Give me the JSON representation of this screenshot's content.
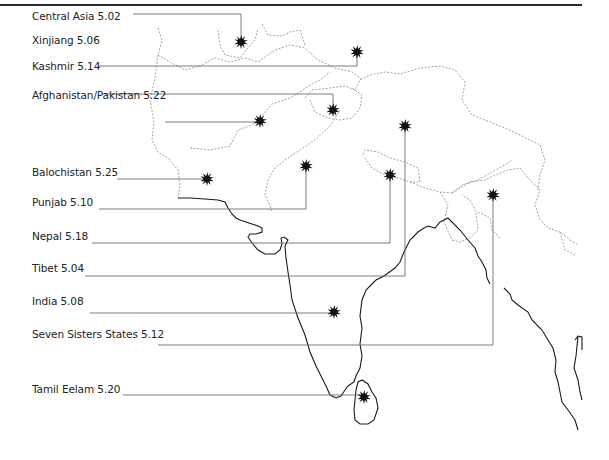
{
  "map": {
    "title": "",
    "region": "South Asia",
    "marker_icon": "starburst-icon",
    "colors": {
      "coastline": "#1a1a1a",
      "border": "#8a8a8a",
      "leader_line": "#6e6e6e",
      "marker": "#111111",
      "text": "#222222",
      "top_rule": "#2a2a2a"
    },
    "labels": [
      {
        "name": "Central Asia",
        "code": "5.02",
        "text": "Central Asia 5.02",
        "label_y": 16,
        "marker": [
          241,
          42
        ],
        "line": [
          [
            133,
            14
          ],
          [
            241,
            14
          ],
          [
            241,
            42
          ]
        ]
      },
      {
        "name": "Xinjiang",
        "code": "5.06",
        "text": "Xinjiang 5.06",
        "label_y": 40,
        "marker": [
          357,
          52
        ],
        "line": [
          [
            98,
            66
          ],
          [
            357,
            66
          ],
          [
            357,
            52
          ]
        ]
      },
      {
        "name": "Kashmir",
        "code": "5.14",
        "text": "Kashmir 5.14",
        "label_y": 66,
        "marker": [
          333,
          110
        ],
        "line": [
          [
            103,
            94
          ],
          [
            333,
            94
          ],
          [
            333,
            110
          ]
        ]
      },
      {
        "name": "Afghanistan/Pakistan",
        "code": "5.22",
        "text": "Afghanistan/Pakistan 5.22",
        "label_y": 95,
        "marker": [
          260,
          121
        ],
        "line": [
          [
            165,
            122
          ],
          [
            260,
            122
          ]
        ]
      },
      {
        "name": "Balochistan",
        "code": "5.25",
        "text": "Balochistan 5.25",
        "label_y": 172,
        "marker": [
          207,
          179
        ],
        "line": [
          [
            117,
            179
          ],
          [
            207,
            179
          ]
        ]
      },
      {
        "name": "Punjab",
        "code": "5.10",
        "text": "Punjab 5.10",
        "label_y": 202,
        "marker": [
          306,
          166
        ],
        "line": [
          [
            99,
            209
          ],
          [
            306,
            209
          ],
          [
            306,
            166
          ]
        ]
      },
      {
        "name": "Nepal",
        "code": "5.18",
        "text": "Nepal 5.18",
        "label_y": 236,
        "marker": [
          390,
          175
        ],
        "line": [
          [
            92,
            243
          ],
          [
            390,
            243
          ],
          [
            390,
            175
          ]
        ]
      },
      {
        "name": "Tibet",
        "code": "5.04",
        "text": "Tibet 5.04",
        "label_y": 268,
        "marker": [
          405,
          126
        ],
        "line": [
          [
            85,
            276
          ],
          [
            405,
            276
          ],
          [
            405,
            126
          ]
        ]
      },
      {
        "name": "India",
        "code": "5.08",
        "text": "India 5.08",
        "label_y": 301,
        "marker": [
          334,
          312
        ],
        "line": [
          [
            90,
            313
          ],
          [
            334,
            313
          ]
        ]
      },
      {
        "name": "Seven Sisters States",
        "code": "5.12",
        "text": "Seven Sisters States 5.12",
        "label_y": 334,
        "marker": [
          493,
          195
        ],
        "line": [
          [
            158,
            345
          ],
          [
            493,
            345
          ],
          [
            493,
            195
          ]
        ]
      },
      {
        "name": "Tamil Eelam",
        "code": "5.20",
        "text": "Tamil Eelam 5.20",
        "label_y": 389,
        "marker": [
          364,
          397
        ],
        "line": [
          [
            123,
            395
          ],
          [
            364,
            395
          ]
        ]
      }
    ]
  }
}
